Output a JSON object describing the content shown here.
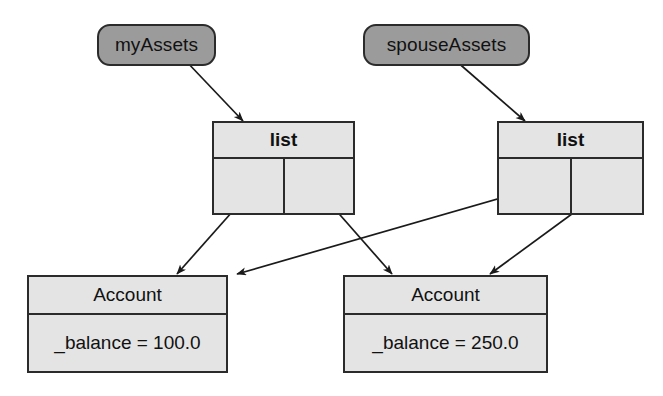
{
  "diagram": {
    "background_color": "#ffffff",
    "line_color": "#1a1a1a",
    "variable_fill": "#9b9b9b",
    "object_fill": "#e4e4e4",
    "border_color": "#2b2b2b"
  },
  "variables": [
    {
      "id": "myAssets",
      "label": "myAssets",
      "x": 97,
      "y": 24,
      "w": 119,
      "h": 42
    },
    {
      "id": "spouseAssets",
      "label": "spouseAssets",
      "x": 363,
      "y": 24,
      "w": 167,
      "h": 42
    }
  ],
  "lists": [
    {
      "id": "list_left",
      "label": "list",
      "x": 212,
      "y": 121,
      "w": 143,
      "h": 94,
      "slots": [
        {
          "name": "slot-0"
        },
        {
          "name": "slot-1"
        }
      ]
    },
    {
      "id": "list_right",
      "label": "list",
      "x": 497,
      "y": 121,
      "w": 147,
      "h": 94,
      "slots": [
        {
          "name": "slot-0"
        },
        {
          "name": "slot-1"
        }
      ]
    }
  ],
  "accounts": [
    {
      "id": "account_100",
      "label": "Account",
      "attribute": "_balance = 100.0",
      "x": 27,
      "y": 275,
      "w": 201,
      "h": 98
    },
    {
      "id": "account_250",
      "label": "Account",
      "attribute": "_balance = 250.0",
      "x": 343,
      "y": 275,
      "w": 205,
      "h": 98
    }
  ],
  "edges": [
    {
      "name": "myAssets-to-list-left",
      "from": "myAssets",
      "to": "list_left",
      "x1": 185,
      "y1": 60,
      "x2": 243,
      "y2": 121
    },
    {
      "name": "spouseAssets-to-list-right",
      "from": "spouseAssets",
      "to": "list_right",
      "x1": 455,
      "y1": 60,
      "x2": 525,
      "y2": 121
    },
    {
      "name": "list-left-slot0-to-account100",
      "from": "list_left",
      "to": "account_100",
      "x1": 248,
      "y1": 194,
      "x2": 177,
      "y2": 274
    },
    {
      "name": "list-left-slot1-to-account250",
      "from": "list_left",
      "to": "account_250",
      "x1": 319,
      "y1": 191,
      "x2": 392,
      "y2": 274
    },
    {
      "name": "list-right-slot0-to-account100",
      "from": "list_right",
      "to": "account_100",
      "x1": 532,
      "y1": 189,
      "x2": 237,
      "y2": 274
    },
    {
      "name": "list-right-slot1-to-account250",
      "from": "list_right",
      "to": "account_250",
      "x1": 606,
      "y1": 189,
      "x2": 490,
      "y2": 274
    }
  ]
}
